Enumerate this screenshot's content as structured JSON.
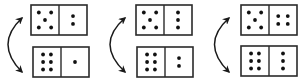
{
  "diagram": {
    "colors": {
      "ink": "#1a1a1a",
      "background": "#ffffff",
      "pip": "#111111"
    },
    "pairs": [
      {
        "top": {
          "left": 5,
          "right": 2
        },
        "bottom": {
          "left": 6,
          "right": 1
        },
        "connector": "double-headed-curved-arrow"
      },
      {
        "top": {
          "left": 5,
          "right": 3
        },
        "bottom": {
          "left": 6,
          "right": 2
        },
        "connector": "double-headed-curved-arrow"
      },
      {
        "top": {
          "left": 5,
          "right": 4
        },
        "bottom": {
          "left": 6,
          "right": 3
        },
        "connector": "double-headed-curved-arrow"
      }
    ]
  }
}
